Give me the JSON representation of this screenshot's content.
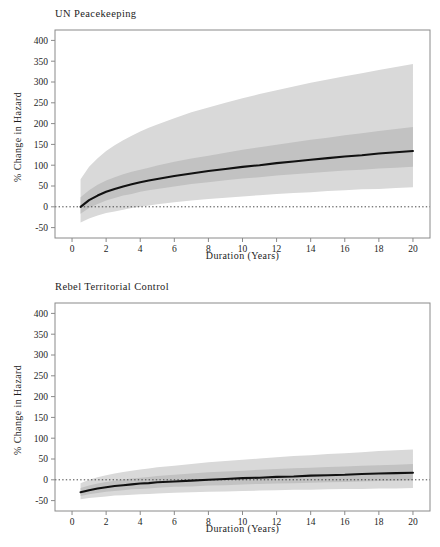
{
  "figure": {
    "width": 440,
    "height": 547,
    "background": "#ffffff",
    "line_color": "#111111",
    "band_outer_color": "#d9d9d9",
    "band_inner_color": "#c2c2c2",
    "frame_color": "#8a8a8a",
    "reference_line_label": "0"
  },
  "chart_data": [
    {
      "type": "line",
      "title": "UN Peacekeeping",
      "xlabel": "Duration (Years)",
      "ylabel": "% Change in Hazard",
      "xlim": [
        -1,
        21
      ],
      "ylim": [
        -75,
        425
      ],
      "xticks": [
        0,
        2,
        4,
        6,
        8,
        10,
        12,
        14,
        16,
        18,
        20
      ],
      "xticklabels": [
        "0",
        "2",
        "4",
        "6",
        "8",
        "10",
        "12",
        "14",
        "16",
        "18",
        "20"
      ],
      "yticks": [
        -50,
        0,
        50,
        100,
        150,
        200,
        250,
        300,
        350,
        400
      ],
      "yticklabels": [
        "-50",
        "0",
        "50",
        "100",
        "150",
        "200",
        "250",
        "300",
        "350",
        "400"
      ],
      "grid": false,
      "legend": "none",
      "reference_line": {
        "y": 0,
        "style": "dotted",
        "x_from": -1,
        "x_to": 21
      },
      "x": [
        0.5,
        1,
        1.5,
        2,
        2.5,
        3,
        3.5,
        4,
        4.5,
        5,
        6,
        7,
        8,
        9,
        10,
        11,
        12,
        13,
        14,
        15,
        16,
        17,
        18,
        19,
        20
      ],
      "series": [
        {
          "name": "estimate",
          "role": "point-estimate",
          "values": [
            0,
            16,
            27,
            36,
            43,
            49,
            54,
            59,
            63,
            67,
            74,
            80,
            86,
            91,
            96,
            100,
            105,
            109,
            113,
            117,
            121,
            124,
            128,
            131,
            134
          ]
        },
        {
          "name": "inner-band-upper",
          "role": "ci-inner-upper",
          "values": [
            23,
            40,
            53,
            63,
            71,
            78,
            84,
            89,
            94,
            99,
            108,
            116,
            123,
            130,
            137,
            143,
            149,
            155,
            161,
            166,
            172,
            177,
            182,
            187,
            192
          ]
        },
        {
          "name": "inner-band-lower",
          "role": "ci-inner-lower",
          "values": [
            -17,
            -3,
            7,
            15,
            21,
            27,
            31,
            36,
            40,
            43,
            49,
            55,
            59,
            64,
            68,
            71,
            75,
            78,
            81,
            84,
            87,
            89,
            92,
            94,
            96
          ]
        },
        {
          "name": "outer-band-upper",
          "role": "ci-outer-upper",
          "values": [
            66,
            96,
            117,
            134,
            148,
            160,
            171,
            181,
            190,
            198,
            213,
            227,
            239,
            250,
            261,
            271,
            280,
            289,
            298,
            306,
            314,
            321,
            329,
            336,
            343
          ]
        },
        {
          "name": "outer-band-lower",
          "role": "ci-outer-lower",
          "values": [
            -38,
            -28,
            -21,
            -15,
            -11,
            -7,
            -3,
            0,
            3,
            6,
            11,
            15,
            19,
            22,
            25,
            28,
            31,
            33,
            35,
            38,
            40,
            42,
            43,
            45,
            47
          ]
        }
      ]
    },
    {
      "type": "line",
      "title": "Rebel Territorial Control",
      "xlabel": "Duration (Years)",
      "ylabel": "% Change in Hazard",
      "xlim": [
        -1,
        21
      ],
      "ylim": [
        -75,
        425
      ],
      "xticks": [
        0,
        2,
        4,
        6,
        8,
        10,
        12,
        14,
        16,
        18,
        20
      ],
      "xticklabels": [
        "0",
        "2",
        "4",
        "6",
        "8",
        "10",
        "12",
        "14",
        "16",
        "18",
        "20"
      ],
      "yticks": [
        -50,
        0,
        50,
        100,
        150,
        200,
        250,
        300,
        350,
        400
      ],
      "yticklabels": [
        "-50",
        "0",
        "50",
        "100",
        "150",
        "200",
        "250",
        "300",
        "350",
        "400"
      ],
      "grid": false,
      "legend": "none",
      "reference_line": {
        "y": 0,
        "style": "dotted",
        "x_from": -1,
        "x_to": 21
      },
      "x": [
        0.5,
        1,
        1.5,
        2,
        2.5,
        3,
        3.5,
        4,
        4.5,
        5,
        6,
        7,
        8,
        9,
        10,
        11,
        12,
        13,
        14,
        15,
        16,
        17,
        18,
        19,
        20
      ],
      "series": [
        {
          "name": "estimate",
          "role": "point-estimate",
          "values": [
            -30,
            -25,
            -21,
            -18,
            -15,
            -13,
            -11,
            -9,
            -8,
            -6,
            -4,
            -2,
            0,
            2,
            4,
            5,
            7,
            8,
            10,
            11,
            12,
            14,
            15,
            16,
            17
          ]
        },
        {
          "name": "inner-band-upper",
          "role": "ci-inner-upper",
          "values": [
            -20,
            -14,
            -9,
            -5,
            -2,
            1,
            3,
            5,
            7,
            9,
            12,
            15,
            18,
            20,
            22,
            24,
            26,
            28,
            29,
            31,
            32,
            34,
            35,
            36,
            38
          ]
        },
        {
          "name": "inner-band-lower",
          "role": "ci-inner-lower",
          "values": [
            -39,
            -35,
            -32,
            -29,
            -27,
            -25,
            -23,
            -22,
            -21,
            -19,
            -17,
            -16,
            -14,
            -13,
            -11,
            -10,
            -9,
            -8,
            -7,
            -6,
            -5,
            -4,
            -3,
            -2,
            -1
          ]
        },
        {
          "name": "outer-band-upper",
          "role": "ci-outer-upper",
          "values": [
            -8,
            0,
            6,
            11,
            15,
            19,
            22,
            25,
            27,
            30,
            34,
            38,
            42,
            45,
            48,
            51,
            54,
            57,
            59,
            62,
            64,
            66,
            69,
            71,
            73
          ]
        },
        {
          "name": "outer-band-lower",
          "role": "ci-outer-lower",
          "values": [
            -47,
            -44,
            -42,
            -40,
            -38,
            -37,
            -36,
            -35,
            -34,
            -33,
            -31,
            -30,
            -29,
            -28,
            -27,
            -26,
            -25,
            -24,
            -24,
            -23,
            -22,
            -22,
            -21,
            -21,
            -20
          ]
        }
      ]
    }
  ]
}
